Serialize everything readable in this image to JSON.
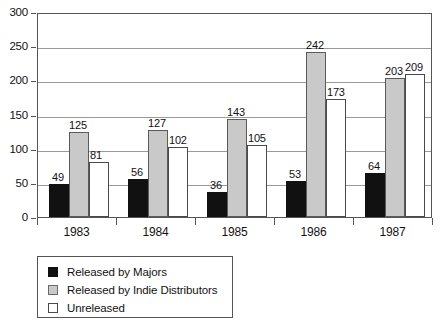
{
  "chart_data": {
    "type": "bar",
    "title": "",
    "subtitle": "",
    "xlabel": "",
    "ylabel": "",
    "categories": [
      "1983",
      "1984",
      "1985",
      "1986",
      "1987"
    ],
    "series": [
      {
        "name": "Released by Majors",
        "color": "#111111",
        "values": [
          49,
          56,
          36,
          53,
          64
        ]
      },
      {
        "name": "Released by Indie Distributors",
        "color": "#c9c9c9",
        "values": [
          125,
          127,
          143,
          242,
          203
        ]
      },
      {
        "name": "Unreleased",
        "color": "#ffffff",
        "values": [
          81,
          102,
          105,
          173,
          209
        ]
      }
    ],
    "ylim": [
      0,
      300
    ],
    "yticks": [
      0,
      50,
      100,
      150,
      200,
      250,
      300
    ],
    "ytick_labels": [
      "0",
      "50",
      "100",
      "150",
      "200",
      "250",
      "300"
    ],
    "grid": true,
    "legend_position": "below-left",
    "show_value_labels": true
  },
  "legend": {
    "items": [
      {
        "label": "Released by Majors",
        "swatch": "majors"
      },
      {
        "label": "Released by Indie Distributors",
        "swatch": "indie"
      },
      {
        "label": "Unreleased",
        "swatch": "unreleased"
      }
    ]
  }
}
